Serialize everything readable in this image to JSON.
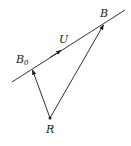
{
  "diagram": {
    "type": "vector-geometry",
    "background": "#ffffff",
    "stroke_color": "#1a1a1a",
    "line": {
      "from": [
        12,
        82
      ],
      "to": [
        125,
        10
      ],
      "arrow_at": [
        60,
        51
      ],
      "arrow_label": "U"
    },
    "points": {
      "B0": {
        "label": "B",
        "subscript": "0",
        "pos": [
          32,
          69
        ]
      },
      "B": {
        "label": "B",
        "pos": [
          104,
          24
        ]
      },
      "R": {
        "label": "R",
        "pos": [
          50,
          118
        ]
      }
    },
    "vectors": [
      {
        "from": "R",
        "to": "B0"
      },
      {
        "from": "R",
        "to": "B"
      }
    ],
    "labels": {
      "B0_main": "B",
      "B0_sub": "0",
      "B": "B",
      "U": "U",
      "R": "R"
    }
  }
}
